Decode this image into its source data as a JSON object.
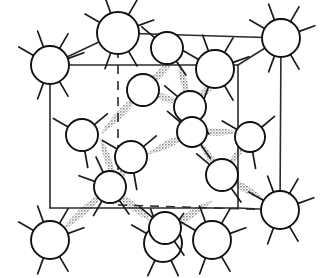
{
  "figure": {
    "title": "Diamond cubic crystal lattice unit cell",
    "background_color": "#ffffff",
    "line_color": "#2b2b2b",
    "atom_fill": "#ffffff",
    "atom_stroke": "#111111",
    "bond_color": "#9a9a9a",
    "bond_style": "stippled-gray-lens"
  },
  "geometry": {
    "cube": {
      "back_face": {
        "label": "back square face",
        "top_left": [
          50,
          65
        ],
        "top_right": [
          238,
          65
        ],
        "bottom_right": [
          238,
          208
        ],
        "bottom_left": [
          50,
          208
        ]
      },
      "front_face": {
        "label": "front square face",
        "top_left": [
          118,
          33
        ],
        "top_right": [
          281,
          38
        ],
        "bottom_right": [
          280,
          210
        ],
        "bottom_left": [
          118,
          205
        ]
      },
      "visible_edges": [
        "back-top-left to back-top-right",
        "back-top-right to back-bottom-right",
        "back-bottom-right to back-bottom-left",
        "back-bottom-left to back-top-left",
        "front-top-left to front-top-right",
        "front-top-right to front-bottom-right",
        "back-top-left to front-top-left",
        "back-top-right to front-top-right",
        "back-bottom-right to front-bottom-right"
      ],
      "hidden_edges": [
        "front-top-left to front-bottom-left (vertical dashed)",
        "front-bottom-left to front-bottom-right (horizontal dashed)"
      ]
    },
    "atoms": [
      {
        "id": "corner-back-top-left",
        "cx": 50,
        "cy": 65,
        "r": 19,
        "type": "corner",
        "stubs": 6
      },
      {
        "id": "corner-front-top-left",
        "cx": 118,
        "cy": 33,
        "r": 21,
        "type": "corner",
        "stubs": 6
      },
      {
        "id": "corner-front-top-right",
        "cx": 281,
        "cy": 38,
        "r": 19,
        "type": "corner",
        "stubs": 6
      },
      {
        "id": "corner-back-top-right",
        "cx": 215,
        "cy": 69,
        "r": 19,
        "type": "corner",
        "stubs": 6
      },
      {
        "id": "corner-back-bottom-left",
        "cx": 50,
        "cy": 240,
        "r": 19,
        "type": "corner",
        "stubs": 6
      },
      {
        "id": "corner-front-bottom-left",
        "cx": 163,
        "cy": 243,
        "r": 19,
        "type": "corner",
        "stubs": 5
      },
      {
        "id": "corner-front-bottom-right",
        "cx": 212,
        "cy": 240,
        "r": 19,
        "type": "corner",
        "stubs": 6
      },
      {
        "id": "corner-back-bottom-right",
        "cx": 280,
        "cy": 210,
        "r": 19,
        "type": "corner",
        "stubs": 6
      },
      {
        "id": "face-left",
        "cx": 82,
        "cy": 135,
        "r": 16,
        "type": "face",
        "stubs": 3
      },
      {
        "id": "face-right",
        "cx": 250,
        "cy": 137,
        "r": 15,
        "type": "face",
        "stubs": 3
      },
      {
        "id": "face-top",
        "cx": 167,
        "cy": 48,
        "r": 16,
        "type": "face",
        "stubs": 2
      },
      {
        "id": "face-bottom",
        "cx": 165,
        "cy": 228,
        "r": 16,
        "type": "face",
        "stubs": 2
      },
      {
        "id": "interior-upper-left",
        "cx": 143,
        "cy": 90,
        "r": 16,
        "type": "interior",
        "stubs": 0
      },
      {
        "id": "interior-upper-right",
        "cx": 190,
        "cy": 107,
        "r": 16,
        "type": "interior",
        "stubs": 2
      },
      {
        "id": "interior-mid-right",
        "cx": 192,
        "cy": 132,
        "r": 15,
        "type": "interior",
        "stubs": 2
      },
      {
        "id": "interior-lower-left",
        "cx": 131,
        "cy": 157,
        "r": 16,
        "type": "interior",
        "stubs": 3
      },
      {
        "id": "interior-lower-right",
        "cx": 222,
        "cy": 175,
        "r": 16,
        "type": "interior",
        "stubs": 2
      },
      {
        "id": "interior-bottom-left",
        "cx": 110,
        "cy": 187,
        "r": 16,
        "type": "interior",
        "stubs": 4
      }
    ],
    "bonds": [
      {
        "id": "bond-1",
        "from": [
          143,
          90
        ],
        "to": [
          100,
          135
        ],
        "width": 15
      },
      {
        "id": "bond-2",
        "from": [
          143,
          90
        ],
        "to": [
          176,
          58
        ],
        "width": 15
      },
      {
        "id": "bond-3",
        "from": [
          143,
          90
        ],
        "to": [
          186,
          105
        ],
        "width": 14
      },
      {
        "id": "bond-4",
        "from": [
          178,
          60
        ],
        "to": [
          190,
          104
        ],
        "width": 14
      },
      {
        "id": "bond-5",
        "from": [
          190,
          107
        ],
        "to": [
          222,
          75
        ],
        "width": 14
      },
      {
        "id": "bond-6",
        "from": [
          192,
          132
        ],
        "to": [
          240,
          132
        ],
        "width": 15
      },
      {
        "id": "bond-7",
        "from": [
          192,
          132
        ],
        "to": [
          146,
          155
        ],
        "width": 15
      },
      {
        "id": "bond-8",
        "from": [
          100,
          137
        ],
        "to": [
          116,
          183
        ],
        "width": 14
      },
      {
        "id": "bond-9",
        "from": [
          131,
          157
        ],
        "to": [
          116,
          186
        ],
        "width": 13
      },
      {
        "id": "bond-10",
        "from": [
          110,
          187
        ],
        "to": [
          60,
          232
        ],
        "width": 15
      },
      {
        "id": "bond-11",
        "from": [
          110,
          187
        ],
        "to": [
          152,
          222
        ],
        "width": 15
      },
      {
        "id": "bond-12",
        "from": [
          167,
          230
        ],
        "to": [
          213,
          200
        ],
        "width": 15
      },
      {
        "id": "bond-13",
        "from": [
          222,
          175
        ],
        "to": [
          265,
          200
        ],
        "width": 15
      },
      {
        "id": "bond-14",
        "from": [
          222,
          175
        ],
        "to": [
          198,
          140
        ],
        "width": 14
      },
      {
        "id": "bond-15",
        "from": [
          248,
          140
        ],
        "to": [
          224,
          172
        ],
        "width": 13
      }
    ]
  }
}
